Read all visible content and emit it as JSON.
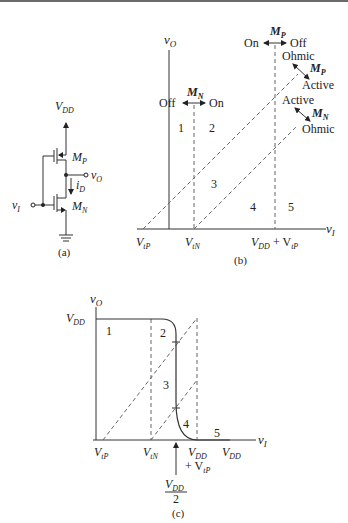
{
  "figure_a": {
    "caption": "(a)",
    "vdd": "V",
    "vdd_sub": "DD",
    "mp": "M",
    "mp_sub": "P",
    "mn": "M",
    "mn_sub": "N",
    "vo": "v",
    "vo_sub": "O",
    "vi": "v",
    "vi_sub": "I",
    "id": "i",
    "id_sub": "D"
  },
  "figure_b": {
    "caption": "(b)",
    "y_axis": "v",
    "y_axis_sub": "O",
    "x_axis": "v",
    "x_axis_sub": "I",
    "mn_label": "M",
    "mn_label_sub": "N",
    "mn_off": "Off",
    "mn_on": "On",
    "mp_label": "M",
    "mp_label_sub": "P",
    "mp_on": "On",
    "mp_off": "Off",
    "mp_ohmic": "Ohmic",
    "mp_active": "Active",
    "mp_diag_label": "M",
    "mp_diag_sub": "P",
    "mn_active": "Active",
    "mn_ohmic": "Ohmic",
    "mn_diag_label": "M",
    "mn_diag_sub": "N",
    "regions": [
      "1",
      "2",
      "3",
      "4",
      "5"
    ],
    "tick_vtp": "V",
    "tick_vtp_sub": "tP",
    "tick_vtn": "V",
    "tick_vtn_sub": "tN",
    "tick_vddvtp_a": "V",
    "tick_vddvtp_a_sub": "DD",
    "tick_vddvtp_b": " + V",
    "tick_vddvtp_b_sub": "tP"
  },
  "figure_c": {
    "caption": "(c)",
    "y_axis": "v",
    "y_axis_sub": "O",
    "x_axis": "v",
    "x_axis_sub": "I",
    "vdd_level": "V",
    "vdd_level_sub": "DD",
    "regions": [
      "1",
      "2",
      "3",
      "4",
      "5"
    ],
    "tick_vtp": "V",
    "tick_vtp_sub": "tP",
    "tick_vtn": "V",
    "tick_vtn_sub": "tN",
    "tick_vdd1": "V",
    "tick_vdd1_sub": "DD",
    "tick_vdd1_line2": "+ V",
    "tick_vdd1_line2_sub": "tP",
    "tick_vdd2": "V",
    "tick_vdd2_sub": "DD",
    "midpoint_num": "V",
    "midpoint_num_sub": "DD",
    "midpoint_den": "2"
  }
}
